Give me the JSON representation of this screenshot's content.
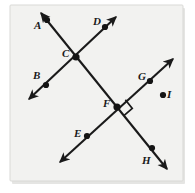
{
  "figure": {
    "kind": "geometry-diagram",
    "panel": {
      "background_color": "#f2f2f0",
      "border_color": "#d9d9d6",
      "shadow_color": "#cfcfcc",
      "x": 10,
      "y": 5,
      "width": 173,
      "height": 176
    },
    "stroke_color": "#1a1a1a",
    "dot_color": "#141414",
    "label_color": "#1a1a1a",
    "lines": [
      {
        "name": "line-ACFH",
        "through_labels": [
          "A",
          "C",
          "F",
          "H"
        ],
        "start": {
          "x": 41,
          "y": 13
        },
        "end": {
          "x": 167,
          "y": 169
        },
        "arrow_start": true,
        "arrow_end": true
      },
      {
        "name": "line-BCD",
        "through_labels": [
          "B",
          "C",
          "D"
        ],
        "start": {
          "x": 29,
          "y": 99
        },
        "end": {
          "x": 116,
          "y": 17
        },
        "arrow_start": true,
        "arrow_end": true
      },
      {
        "name": "line-EFG",
        "through_labels": [
          "E",
          "F",
          "G"
        ],
        "start": {
          "x": 60,
          "y": 162
        },
        "end": {
          "x": 173,
          "y": 59
        },
        "arrow_start": true,
        "arrow_end": true
      }
    ],
    "points": [
      {
        "label": "A",
        "dot_x": 47,
        "dot_y": 20,
        "label_x": 34,
        "label_y": 20,
        "radius": 3.1,
        "on_lines": [
          "line-ACFH"
        ]
      },
      {
        "label": "B",
        "dot_x": 46,
        "dot_y": 85,
        "label_x": 33,
        "label_y": 70,
        "radius": 3.1,
        "on_lines": [
          "line-BCD"
        ]
      },
      {
        "label": "C",
        "dot_x": 76,
        "dot_y": 57,
        "label_x": 62,
        "label_y": 48,
        "radius": 3.6,
        "on_lines": [
          "line-ACFH",
          "line-BCD"
        ]
      },
      {
        "label": "D",
        "dot_x": 105,
        "dot_y": 27,
        "label_x": 93,
        "label_y": 16,
        "radius": 3.1,
        "on_lines": [
          "line-BCD"
        ]
      },
      {
        "label": "E",
        "dot_x": 87,
        "dot_y": 136,
        "label_x": 74,
        "label_y": 128,
        "radius": 3.1,
        "on_lines": [
          "line-EFG"
        ]
      },
      {
        "label": "F",
        "dot_x": 117,
        "dot_y": 107,
        "label_x": 103,
        "label_y": 98,
        "radius": 3.6,
        "on_lines": [
          "line-ACFH",
          "line-EFG"
        ]
      },
      {
        "label": "G",
        "dot_x": 150,
        "dot_y": 81,
        "label_x": 138,
        "label_y": 71,
        "radius": 3.1,
        "on_lines": [
          "line-EFG"
        ]
      },
      {
        "label": "H",
        "dot_x": 152,
        "dot_y": 148,
        "label_x": 142,
        "label_y": 155,
        "radius": 3.1,
        "on_lines": [
          "line-ACFH"
        ]
      },
      {
        "label": "I",
        "dot_x": 163,
        "dot_y": 95,
        "label_x": 167,
        "label_y": 89,
        "radius": 3.1,
        "on_lines": []
      }
    ],
    "right_angle": {
      "name": "right-angle-marker-at-F",
      "vertex_label": "F",
      "vertex_x": 117,
      "vertex_y": 107,
      "size": 11,
      "note": "square marker indicating perpendicular lines at point F"
    }
  }
}
